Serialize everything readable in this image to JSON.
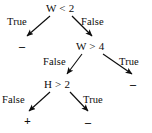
{
  "figure": {
    "type": "decision-tree",
    "background_color": "#ffffff",
    "ink_color": "#0d0d0d"
  },
  "nodes": [
    {
      "id": "root",
      "label": "W < 2"
    },
    {
      "id": "w4",
      "label": "W > 4"
    },
    {
      "id": "h2",
      "label": "H > 2"
    }
  ],
  "edges": [
    {
      "id": "root-true",
      "from": "root",
      "to": "leaf-minus-1",
      "label": "True"
    },
    {
      "id": "root-false",
      "from": "root",
      "to": "w4",
      "label": "False"
    },
    {
      "id": "w4-false",
      "from": "w4",
      "to": "h2",
      "label": "False"
    },
    {
      "id": "w4-true",
      "from": "w4",
      "to": "leaf-minus-2",
      "label": "True"
    },
    {
      "id": "h2-false",
      "from": "h2",
      "to": "leaf-plus",
      "label": "False"
    },
    {
      "id": "h2-true",
      "from": "h2",
      "to": "leaf-minus-3",
      "label": "True"
    }
  ],
  "leaves": [
    {
      "id": "leaf-minus-1",
      "label": "–"
    },
    {
      "id": "leaf-minus-2",
      "label": "–"
    },
    {
      "id": "leaf-plus",
      "label": "+"
    },
    {
      "id": "leaf-minus-3",
      "label": "–"
    }
  ]
}
